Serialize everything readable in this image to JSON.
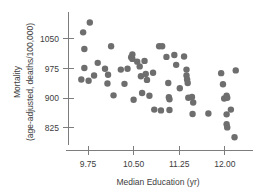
{
  "chart_data": {
    "type": "scatter",
    "title": "",
    "subtitle": "",
    "xlabel": "Median Education (yr)",
    "ylabel": "Mortality\n(age-adjusted, deaths/100,000)",
    "ylabel_line1": "Mortality",
    "ylabel_line2": "(age-adjusted, deaths/100,000)",
    "xlim": [
      9.45,
      12.35
    ],
    "ylim": [
      790,
      1105
    ],
    "xticks": [
      9.75,
      10.5,
      11.25,
      12.0
    ],
    "xtick_labels": [
      "9.75",
      "10.50",
      "11.25",
      "12.00"
    ],
    "yticks": [
      825,
      900,
      975,
      1050
    ],
    "ytick_labels": [
      "825",
      "900",
      "975",
      "1050"
    ],
    "grid": false,
    "legend": null,
    "legend_position": "none",
    "marker": "filled-circle",
    "marker_color": "#6e6e6e",
    "marker_size_px": 3.2,
    "n_points": 60,
    "points": [
      {
        "x": 9.78,
        "y": 1091
      },
      {
        "x": 9.67,
        "y": 1066
      },
      {
        "x": 9.69,
        "y": 1024
      },
      {
        "x": 9.69,
        "y": 976
      },
      {
        "x": 9.64,
        "y": 947
      },
      {
        "x": 9.76,
        "y": 944
      },
      {
        "x": 9.85,
        "y": 957
      },
      {
        "x": 9.91,
        "y": 989
      },
      {
        "x": 10.03,
        "y": 974
      },
      {
        "x": 10.08,
        "y": 959
      },
      {
        "x": 10.07,
        "y": 937
      },
      {
        "x": 10.13,
        "y": 1031
      },
      {
        "x": 10.17,
        "y": 907
      },
      {
        "x": 10.29,
        "y": 972
      },
      {
        "x": 10.35,
        "y": 936
      },
      {
        "x": 10.4,
        "y": 974
      },
      {
        "x": 10.46,
        "y": 1003
      },
      {
        "x": 10.48,
        "y": 1010
      },
      {
        "x": 10.48,
        "y": 999
      },
      {
        "x": 10.5,
        "y": 896
      },
      {
        "x": 10.56,
        "y": 992
      },
      {
        "x": 10.6,
        "y": 980
      },
      {
        "x": 10.62,
        "y": 955
      },
      {
        "x": 10.64,
        "y": 913
      },
      {
        "x": 10.68,
        "y": 994
      },
      {
        "x": 10.7,
        "y": 961
      },
      {
        "x": 10.72,
        "y": 946
      },
      {
        "x": 10.76,
        "y": 906
      },
      {
        "x": 10.82,
        "y": 964
      },
      {
        "x": 10.84,
        "y": 871
      },
      {
        "x": 10.92,
        "y": 1031
      },
      {
        "x": 10.97,
        "y": 1031
      },
      {
        "x": 10.95,
        "y": 869
      },
      {
        "x": 11.04,
        "y": 1004
      },
      {
        "x": 11.07,
        "y": 938
      },
      {
        "x": 11.08,
        "y": 902
      },
      {
        "x": 11.09,
        "y": 897
      },
      {
        "x": 11.09,
        "y": 870
      },
      {
        "x": 11.17,
        "y": 1009
      },
      {
        "x": 11.2,
        "y": 984
      },
      {
        "x": 11.26,
        "y": 925
      },
      {
        "x": 11.33,
        "y": 1005
      },
      {
        "x": 11.37,
        "y": 972
      },
      {
        "x": 11.37,
        "y": 957
      },
      {
        "x": 11.38,
        "y": 947
      },
      {
        "x": 11.39,
        "y": 938
      },
      {
        "x": 11.4,
        "y": 901
      },
      {
        "x": 11.46,
        "y": 903
      },
      {
        "x": 11.48,
        "y": 889
      },
      {
        "x": 11.47,
        "y": 860
      },
      {
        "x": 11.73,
        "y": 861
      },
      {
        "x": 11.94,
        "y": 963
      },
      {
        "x": 11.97,
        "y": 935
      },
      {
        "x": 11.99,
        "y": 899
      },
      {
        "x": 12.03,
        "y": 906
      },
      {
        "x": 12.04,
        "y": 901
      },
      {
        "x": 12.03,
        "y": 859
      },
      {
        "x": 12.03,
        "y": 834
      },
      {
        "x": 12.04,
        "y": 826
      },
      {
        "x": 12.1,
        "y": 871
      },
      {
        "x": 12.18,
        "y": 970
      },
      {
        "x": 12.16,
        "y": 801
      }
    ]
  },
  "axes": {
    "y_axis_name": "mortality-axis",
    "x_axis_name": "median-education-axis"
  }
}
